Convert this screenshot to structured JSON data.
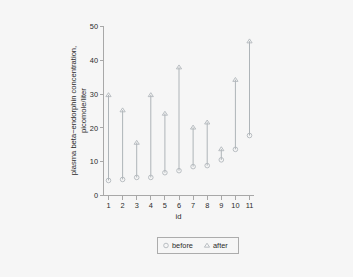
{
  "chart_data": {
    "type": "scatter",
    "title": "",
    "xlabel": "id",
    "ylabel": "plasma beta-endorphin concentration, picomole/liter",
    "ylabel_lines": [
      "plasma beta−endorphin concentration,",
      "picomole/liter"
    ],
    "categories": [
      "1",
      "2",
      "3",
      "4",
      "5",
      "6",
      "7",
      "8",
      "9",
      "10",
      "11"
    ],
    "x": [
      1,
      2,
      3,
      4,
      5,
      6,
      7,
      8,
      9,
      10,
      11
    ],
    "series": [
      {
        "name": "before",
        "marker": "circle",
        "values": [
          4.3,
          4.6,
          5.2,
          5.2,
          6.6,
          7.2,
          8.4,
          8.7,
          10.4,
          13.5,
          17.6
        ]
      },
      {
        "name": "after",
        "marker": "triangle",
        "values": [
          29.6,
          25.1,
          15.5,
          29.6,
          24.1,
          37.8,
          20.0,
          21.5,
          13.6,
          34.1,
          45.5
        ]
      }
    ],
    "connectors": true,
    "xlim": [
      0.45,
      11.55
    ],
    "ylim": [
      0,
      50
    ],
    "yticks": [
      0,
      10,
      20,
      30,
      40,
      50
    ],
    "ytick_labels": [
      "0",
      "10",
      "20",
      "30",
      "40",
      "50"
    ],
    "xticks": [
      1,
      2,
      3,
      4,
      5,
      6,
      7,
      8,
      9,
      10,
      11
    ],
    "xtick_labels": [
      "1",
      "2",
      "3",
      "4",
      "5",
      "6",
      "7",
      "8",
      "9",
      "10",
      "11"
    ],
    "grid": false,
    "legend_position": "bottom-center",
    "legend": [
      "before",
      "after"
    ],
    "colors": {
      "marker": "#b2b8bc",
      "connector": "#aeb4b8",
      "axis": "#a8a8a8",
      "text": "#2b2b2b",
      "background": "#f6f6f6",
      "legend_border": "#9a9a9a"
    }
  }
}
